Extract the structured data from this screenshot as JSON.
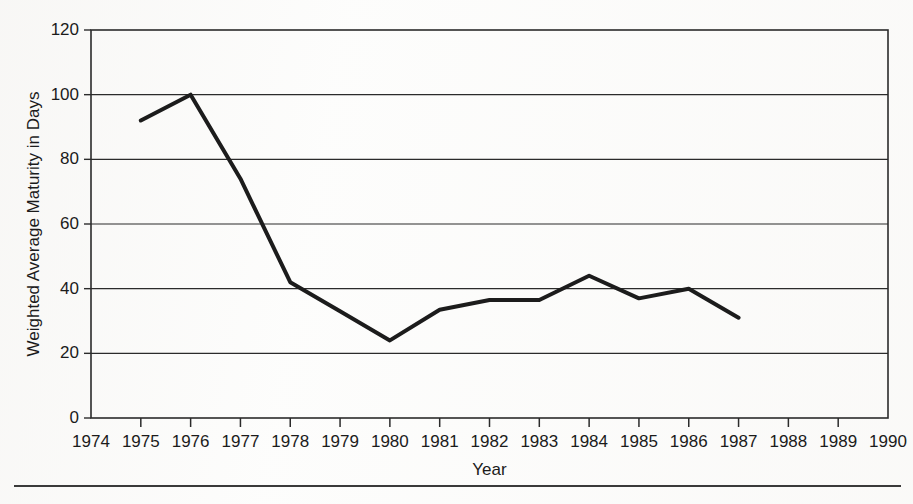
{
  "chart_data": {
    "type": "line",
    "title": "",
    "xlabel": "Year",
    "ylabel": "Weighted Average Maturity in Days",
    "xlim": [
      1974,
      1990
    ],
    "ylim": [
      0,
      120
    ],
    "grid": true,
    "legend": "none",
    "x_ticks": [
      1974,
      1975,
      1976,
      1977,
      1978,
      1979,
      1980,
      1981,
      1982,
      1983,
      1984,
      1985,
      1986,
      1987,
      1988,
      1989,
      1990
    ],
    "x_tick_labels": [
      "1974",
      "1975",
      "1976",
      "1977",
      "1978",
      "1979",
      "1980",
      "1981",
      "1982",
      "1983",
      "1984",
      "1985",
      "1986",
      "1987",
      "1988",
      "1989",
      "1990"
    ],
    "y_ticks": [
      0,
      20,
      40,
      60,
      80,
      100,
      120
    ],
    "y_tick_labels": [
      "0",
      "20",
      "40",
      "60",
      "80",
      "100",
      "120"
    ],
    "line_color": "#1c1c1c",
    "line_width": 4,
    "series": [
      {
        "name": "Weighted Average Maturity",
        "x": [
          1975,
          1976,
          1977,
          1978,
          1979,
          1980,
          1981,
          1982,
          1983,
          1984,
          1985,
          1986,
          1987
        ],
        "values": [
          92,
          100,
          74,
          42,
          33,
          24,
          33.5,
          36.5,
          36.5,
          44,
          37,
          40,
          31
        ]
      }
    ]
  },
  "figure": {
    "y_axis_title": "Weighted Average Maturity in Days",
    "x_axis_title": "Year",
    "bottom_rule": true
  }
}
